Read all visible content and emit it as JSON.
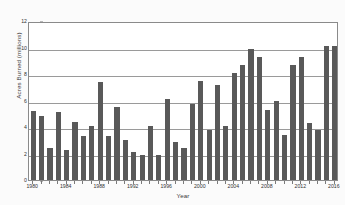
{
  "chart_data": {
    "type": "bar",
    "title": "",
    "xlabel": "Year",
    "ylabel": "Acres Burned (millions)",
    "ylim": [
      0,
      12
    ],
    "ytick_labels": [
      "0",
      "2",
      "4",
      "6",
      "8",
      "10",
      "12"
    ],
    "ytick_values": [
      0,
      2,
      4,
      6,
      8,
      10,
      12
    ],
    "grid": true,
    "grid_axis": "y",
    "legend": "none",
    "bar_color": "#595959",
    "categories": [
      "1980",
      "1981",
      "1982",
      "1983",
      "1984",
      "1985",
      "1986",
      "1987",
      "1988",
      "1989",
      "1990",
      "1991",
      "1992",
      "1993",
      "1994",
      "1995",
      "1996",
      "1997",
      "1998",
      "1999",
      "2000",
      "2001",
      "2002",
      "2003",
      "2004",
      "2005",
      "2006",
      "2007",
      "2008",
      "2009",
      "2010",
      "2011",
      "2012",
      "2013",
      "2014",
      "2015",
      "2016"
    ],
    "values": [
      5.2,
      4.8,
      2.4,
      5.1,
      2.3,
      4.4,
      3.3,
      4.1,
      7.4,
      3.3,
      5.5,
      3.0,
      2.1,
      1.9,
      4.1,
      1.9,
      6.1,
      2.9,
      2.4,
      5.7,
      7.5,
      3.8,
      7.2,
      4.1,
      8.1,
      8.7,
      9.9,
      9.3,
      5.3,
      6.0,
      3.4,
      8.7,
      9.3,
      4.3,
      3.8,
      10.1,
      10.1
    ],
    "xtick_labels": [
      "1980",
      "1984",
      "1988",
      "1992",
      "1996",
      "2000",
      "2004",
      "2008",
      "2012",
      "2016"
    ],
    "xtick_categories": [
      "1980",
      "1984",
      "1988",
      "1992",
      "1996",
      "2000",
      "2004",
      "2008",
      "2012",
      "2016"
    ]
  }
}
